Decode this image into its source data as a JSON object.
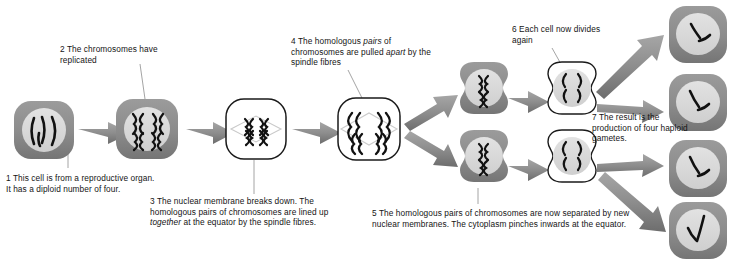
{
  "diagram": {
    "colors": {
      "cytoplasm_grey": "#8c8c8c",
      "cytoplasm_grey_dark": "#6e6e6e",
      "nucleus_light": "#d8d8d8",
      "chromosome_black": "#111111",
      "arrow_grey": "#8f8f8f",
      "arrow_grey_dark": "#6b6b6b",
      "outline_black": "#1a1a1a",
      "leader_line": "#9a9a9a",
      "text_black": "#141414",
      "cell_white": "#ffffff"
    },
    "captions": [
      {
        "id": "caption-1",
        "number": "1",
        "text": "1 This cell is from a reproductive organ. It has a diploid number of four."
      },
      {
        "id": "caption-2",
        "number": "2",
        "text": "2 The chromosomes have replicated"
      },
      {
        "id": "caption-3",
        "number": "3",
        "text_before": "3 The nuclear membrane breaks down. The homologous pairs of chromosomes are lined up ",
        "italic": "together",
        "text_after": " at the equator by the spindle fibres."
      },
      {
        "id": "caption-4",
        "number": "4",
        "text_before": "4 The homologous ",
        "italic_1": "pairs",
        "text_mid": " of chromosomes are pulled ",
        "italic_2": "apart",
        "text_after": " by the spindle fibres"
      },
      {
        "id": "caption-5",
        "number": "5",
        "text": "5 The homologous pairs of chromosomes are now separated by new nuclear membranes. The cytoplasm pinches inwards at the equator."
      },
      {
        "id": "caption-6",
        "number": "6",
        "text": "6 Each cell now divides again"
      },
      {
        "id": "caption-7",
        "number": "7",
        "text": "7 The result is the production of four haploid gametes."
      }
    ],
    "cells": [
      {
        "id": "cell-parent",
        "stage_number": "1",
        "name": "parent-diploid-cell",
        "style": "grey",
        "chromosome_count": "4",
        "chromosome_form": "single curved"
      },
      {
        "id": "cell-replicated",
        "stage_number": "2",
        "name": "replicated-chromosomes-cell",
        "style": "grey",
        "chromosome_count": "4",
        "chromosome_form": "X-shaped replicated"
      },
      {
        "id": "cell-equator",
        "stage_number": "3",
        "name": "metaphase-i-cell",
        "style": "white",
        "chromosome_count": "4",
        "chromosome_form": "X-shaped aligned at equator"
      },
      {
        "id": "cell-anaphase",
        "stage_number": "4",
        "name": "anaphase-i-cell",
        "style": "white",
        "chromosome_count": "4",
        "chromosome_form": "X-shaped pulled to poles"
      },
      {
        "id": "cell-daughter-top",
        "stage_number": "5",
        "name": "daughter-cell-top",
        "style": "grey",
        "chromosome_count": "2",
        "chromosome_form": "X-shaped"
      },
      {
        "id": "cell-daughter-bottom",
        "stage_number": "5",
        "name": "daughter-cell-bottom",
        "style": "grey",
        "chromosome_count": "2",
        "chromosome_form": "X-shaped"
      },
      {
        "id": "cell-division-top",
        "stage_number": "6",
        "name": "second-division-cell-top",
        "style": "white",
        "chromosome_count": "4",
        "chromosome_form": "chromatids separating"
      },
      {
        "id": "cell-division-bottom",
        "stage_number": "6",
        "name": "second-division-cell-bottom",
        "style": "white",
        "chromosome_count": "4",
        "chromosome_form": "chromatids separating"
      },
      {
        "id": "gamete-1",
        "stage_number": "7",
        "name": "haploid-gamete-1",
        "style": "grey",
        "chromosome_count": "2",
        "chromosome_form": "single curved"
      },
      {
        "id": "gamete-2",
        "stage_number": "7",
        "name": "haploid-gamete-2",
        "style": "grey",
        "chromosome_count": "2",
        "chromosome_form": "single curved"
      },
      {
        "id": "gamete-3",
        "stage_number": "7",
        "name": "haploid-gamete-3",
        "style": "grey",
        "chromosome_count": "2",
        "chromosome_form": "single curved"
      },
      {
        "id": "gamete-4",
        "stage_number": "7",
        "name": "haploid-gamete-4",
        "style": "grey",
        "chromosome_count": "2",
        "chromosome_form": "single curved"
      }
    ]
  }
}
